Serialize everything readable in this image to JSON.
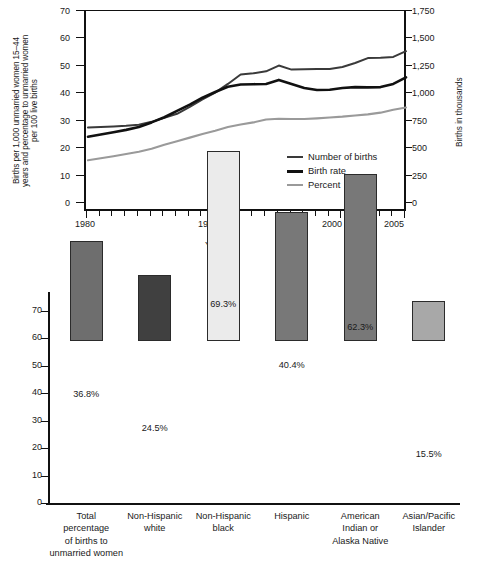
{
  "chart_data": [
    {
      "type": "line",
      "title": "",
      "xlabel": "Year",
      "ylabel": "Births per 1,000 unmarried women 15–44\nyears and percentage to unmarried women\nper 100 live births",
      "ylabel_right": "Births in thousands",
      "xlim": [
        1980,
        2005
      ],
      "ylim": [
        0,
        70
      ],
      "ylim_right": [
        0,
        1750
      ],
      "yticks": [
        0,
        10,
        20,
        30,
        40,
        50,
        60,
        70
      ],
      "ytick_labels": [
        "0",
        "10",
        "20",
        "30",
        "40",
        "50",
        "60",
        "70"
      ],
      "yticks_right": [
        0,
        250,
        500,
        750,
        1000,
        1250,
        1500,
        1750
      ],
      "ytick_labels_right": [
        "0",
        "250",
        "500",
        "750",
        "1,000",
        "1,250",
        "1,500",
        "1,750"
      ],
      "xticks": [
        1980,
        1990,
        2000,
        2005
      ],
      "xtick_labels": [
        "1980",
        "1990",
        "2000",
        "2005"
      ],
      "grid": false,
      "legend_position": "inside-lower-right",
      "x": [
        1980,
        1981,
        1982,
        1983,
        1984,
        1985,
        1986,
        1987,
        1988,
        1989,
        1990,
        1991,
        1992,
        1993,
        1994,
        1995,
        1996,
        1997,
        1998,
        1999,
        2000,
        2001,
        2002,
        2003,
        2004,
        2005
      ],
      "series": [
        {
          "name": "Number of births",
          "color": "#3a3a3a",
          "axis": "right",
          "units": "thousands",
          "values_left_scale": [
            29.4,
            29.6,
            29.8,
            30.0,
            30.4,
            31.4,
            32.8,
            34.2,
            36.6,
            39.2,
            41.6,
            44.6,
            47.9,
            48.3,
            49.0,
            51.0,
            49.6,
            49.7,
            49.8,
            49.8,
            50.5,
            51.9,
            53.6,
            53.7,
            54.0,
            56.0
          ],
          "values": [
            735,
            740,
            745,
            750,
            760,
            785,
            820,
            855,
            915,
            980,
            1040,
            1115,
            1198,
            1208,
            1225,
            1275,
            1240,
            1243,
            1245,
            1245,
            1263,
            1298,
            1340,
            1343,
            1350,
            1400
          ]
        },
        {
          "name": "Birth rate",
          "color": "#111111",
          "axis": "left",
          "units": "births per 1,000 unmarried women 15-44",
          "values": [
            26.2,
            27.0,
            27.8,
            28.6,
            29.6,
            31.2,
            33.0,
            35.2,
            37.4,
            39.8,
            41.8,
            43.6,
            44.4,
            44.5,
            44.6,
            46.0,
            44.6,
            43.2,
            42.5,
            42.6,
            43.2,
            43.5,
            43.4,
            43.5,
            44.6,
            46.9
          ]
        },
        {
          "name": "Percent",
          "color": "#9a9a9a",
          "axis": "left",
          "units": "percentage of births to unmarried women per 100 live births",
          "values": [
            18.0,
            18.7,
            19.4,
            20.2,
            21.0,
            22.0,
            23.4,
            24.6,
            25.9,
            27.2,
            28.3,
            29.6,
            30.5,
            31.2,
            32.2,
            32.5,
            32.4,
            32.4,
            32.6,
            32.9,
            33.2,
            33.6,
            34.0,
            34.6,
            35.6,
            36.4
          ]
        }
      ]
    },
    {
      "type": "bar",
      "title": "",
      "xlabel": "",
      "ylabel": "Percentage",
      "ylim": [
        0,
        74
      ],
      "yticks": [
        0,
        10,
        20,
        30,
        40,
        50,
        60,
        70
      ],
      "ytick_labels": [
        "0",
        "10",
        "20",
        "30",
        "40",
        "50",
        "60",
        "70"
      ],
      "grid": false,
      "categories": [
        "Total\npercentage\nof births to\nunmarried women",
        "Non-Hispanic\nwhite",
        "Non-Hispanic\nblack",
        "Hispanic",
        "American\nIndian or\nAlaska Native",
        "Asian/Pacific\nIslander"
      ],
      "values": [
        36.8,
        24.5,
        69.3,
        40.4,
        62.3,
        15.5
      ],
      "value_labels": [
        "36.8%",
        "24.5%",
        "69.3%",
        "40.4%",
        "62.3%",
        "15.5%"
      ],
      "drawn_heights": [
        36.3,
        24.0,
        69.1,
        47.0,
        61.0,
        14.7
      ],
      "bar_colors": [
        "#6e6e6e",
        "#404040",
        "#ebebeb",
        "#787878",
        "#787878",
        "#a8a8a8"
      ]
    }
  ]
}
